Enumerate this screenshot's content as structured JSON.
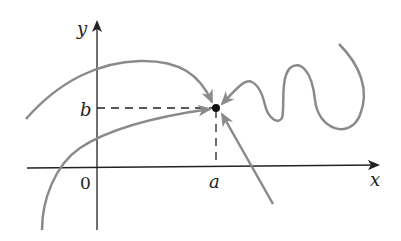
{
  "diagram": {
    "axes": {
      "x_label": "x",
      "y_label": "y",
      "origin_label": "0"
    },
    "point": {
      "x_label": "a",
      "y_label": "b"
    },
    "colors": {
      "axis": "#222222",
      "curve": "#8a8a8a",
      "point": "#111111",
      "dash": "#222222"
    },
    "paths": [
      {
        "name": "upper-arc-path",
        "description": "arc from upper-left approaching point from above"
      },
      {
        "name": "lower-left-curve-path",
        "description": "curve from lower-left approaching point from left"
      },
      {
        "name": "wiggly-path",
        "description": "oscillating curve from right approaching point"
      },
      {
        "name": "straight-line-path",
        "description": "straight line from lower-right approaching point"
      }
    ]
  }
}
